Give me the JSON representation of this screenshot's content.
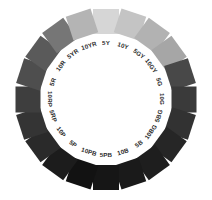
{
  "figure": {
    "name": "munsell-hue-circle",
    "background_color": "#ffffff",
    "center_x": 106,
    "center_y": 99,
    "radius": 78,
    "swatch_size": 26,
    "label_color": "#2b2b2b"
  },
  "chart_data": {
    "type": "pie",
    "title": "",
    "subtitle": "",
    "xlabel": "",
    "ylabel": "",
    "legend_position": "none",
    "grid": false,
    "categories": [
      "5Y",
      "10Y",
      "5GY",
      "10GY",
      "5G",
      "10G",
      "5BG",
      "10BG",
      "5B",
      "10B",
      "5PB",
      "10PB",
      "5P",
      "10P",
      "5RP",
      "10RP",
      "5R",
      "10R",
      "5YR",
      "10YR"
    ],
    "values": [
      18,
      18,
      18,
      18,
      18,
      18,
      18,
      18,
      18,
      18,
      18,
      18,
      18,
      18,
      18,
      18,
      18,
      18,
      18,
      18
    ],
    "series": [
      {
        "name": "gray_value",
        "values": [
          214,
          196,
          178,
          166,
          72,
          58,
          50,
          38,
          30,
          26,
          22,
          18,
          28,
          42,
          52,
          62,
          78,
          90,
          118,
          180
        ]
      }
    ],
    "swatches": [
      {
        "label": "5Y",
        "angle_deg": 0,
        "color": "#d6d6d6",
        "label_rotation": 0
      },
      {
        "label": "10Y",
        "angle_deg": 18,
        "color": "#c4c4c4",
        "label_rotation": 18
      },
      {
        "label": "5GY",
        "angle_deg": 36,
        "color": "#b2b2b2",
        "label_rotation": 36
      },
      {
        "label": "10GY",
        "angle_deg": 54,
        "color": "#a6a6a6",
        "label_rotation": 54
      },
      {
        "label": "5G",
        "angle_deg": 72,
        "color": "#484848",
        "label_rotation": 72
      },
      {
        "label": "10G",
        "angle_deg": 90,
        "color": "#3a3a3a",
        "label_rotation": 90
      },
      {
        "label": "5BG",
        "angle_deg": 108,
        "color": "#323232",
        "label_rotation": -72
      },
      {
        "label": "10BG",
        "angle_deg": 126,
        "color": "#262626",
        "label_rotation": -54
      },
      {
        "label": "5B",
        "angle_deg": 144,
        "color": "#1e1e1e",
        "label_rotation": -36
      },
      {
        "label": "10B",
        "angle_deg": 162,
        "color": "#1a1a1a",
        "label_rotation": -18
      },
      {
        "label": "5PB",
        "angle_deg": 180,
        "color": "#161616",
        "label_rotation": 0
      },
      {
        "label": "10PB",
        "angle_deg": 198,
        "color": "#121212",
        "label_rotation": 18
      },
      {
        "label": "5P",
        "angle_deg": 216,
        "color": "#1c1c1c",
        "label_rotation": 36
      },
      {
        "label": "10P",
        "angle_deg": 234,
        "color": "#2a2a2a",
        "label_rotation": 54
      },
      {
        "label": "5RP",
        "angle_deg": 252,
        "color": "#343434",
        "label_rotation": 72
      },
      {
        "label": "10RP",
        "angle_deg": 270,
        "color": "#3e3e3e",
        "label_rotation": 90
      },
      {
        "label": "5R",
        "angle_deg": 288,
        "color": "#4e4e4e",
        "label_rotation": -72
      },
      {
        "label": "10R",
        "angle_deg": 306,
        "color": "#5a5a5a",
        "label_rotation": -54
      },
      {
        "label": "5YR",
        "angle_deg": 324,
        "color": "#767676",
        "label_rotation": -36
      },
      {
        "label": "10YR",
        "angle_deg": 342,
        "color": "#b4b4b4",
        "label_rotation": -18
      }
    ]
  }
}
